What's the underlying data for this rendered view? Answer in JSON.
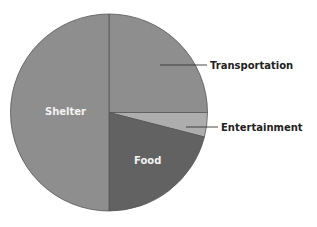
{
  "chart_data": {
    "type": "pie",
    "title": "",
    "slices": [
      {
        "label": "Transportation",
        "value": 25,
        "color": "#8e8e8e",
        "label_position": "outside"
      },
      {
        "label": "Entertainment",
        "value": 4,
        "color": "#adadad",
        "label_position": "outside"
      },
      {
        "label": "Food",
        "value": 21,
        "color": "#626262",
        "label_position": "inside"
      },
      {
        "label": "Shelter",
        "value": 50,
        "color": "#8e8e8e",
        "label_position": "inside"
      }
    ],
    "start_angle_deg": 90,
    "direction": "clockwise",
    "legend": "none",
    "outline_color": "#555555"
  },
  "labels": {
    "transportation": "Transportation",
    "entertainment": "Entertainment",
    "food": "Food",
    "shelter": "Shelter"
  }
}
